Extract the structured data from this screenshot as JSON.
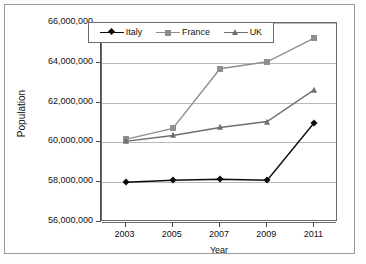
{
  "chart_data": {
    "type": "line",
    "title": "",
    "xlabel": "Year",
    "ylabel": "Population",
    "categories": [
      "2003",
      "2005",
      "2007",
      "2009",
      "2011"
    ],
    "x": [
      2003,
      2005,
      2007,
      2009,
      2011
    ],
    "ylim": [
      56000000,
      66000000
    ],
    "ytick_values": [
      56000000,
      58000000,
      60000000,
      62000000,
      64000000,
      66000000
    ],
    "ytick_labels": [
      "56,000,000",
      "58,000,000",
      "60,000,000",
      "62,000,000",
      "64,000,000",
      "66,000,000"
    ],
    "grid": true,
    "grid_axis": "y",
    "legend_position": "top-inside",
    "series": [
      {
        "name": "Italy",
        "marker": "diamond",
        "color": "#0d0d0d",
        "values": [
          58000000,
          58100000,
          58150000,
          58100000,
          61000000
        ]
      },
      {
        "name": "France",
        "marker": "square",
        "color": "#8f8f8f",
        "values": [
          60150000,
          60700000,
          63700000,
          64050000,
          65250000
        ]
      },
      {
        "name": "UK",
        "marker": "triangle",
        "color": "#6f6f6f",
        "values": [
          60050000,
          60350000,
          60750000,
          61050000,
          62650000
        ]
      }
    ]
  },
  "legend": {
    "items": [
      {
        "label": "Italy"
      },
      {
        "label": "France"
      },
      {
        "label": "UK"
      }
    ]
  },
  "axes": {
    "y_title": "Population",
    "x_title": "Year"
  }
}
